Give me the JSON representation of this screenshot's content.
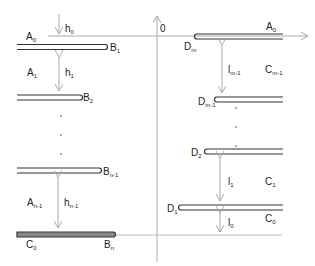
{
  "diagram": {
    "origin_label": "0",
    "left_plates": [
      {
        "name": "top",
        "left_label": "A",
        "left_sub": "0",
        "right_label": "B",
        "right_sub": "1"
      },
      {
        "name": "second",
        "right_label": "B",
        "right_sub": "2"
      },
      {
        "name": "penultimate",
        "right_label": "B",
        "right_sub": "n-1"
      },
      {
        "name": "bottom",
        "left_label": "C",
        "left_sub": "0",
        "right_label": "B",
        "right_sub": "n"
      }
    ],
    "left_regions": [
      {
        "label": "A",
        "sub": "1"
      },
      {
        "label": "A",
        "sub": "n-1"
      }
    ],
    "left_gaps": [
      {
        "label": "h",
        "sub": "0"
      },
      {
        "label": "h",
        "sub": "1"
      },
      {
        "label": "h",
        "sub": "n-1"
      }
    ],
    "right_plates": [
      {
        "name": "top",
        "left_label": "D",
        "left_sub": "m",
        "right_label": "A",
        "right_sub": "0"
      },
      {
        "name": "second",
        "left_label": "D",
        "left_sub": "m-1"
      },
      {
        "name": "third-from-bottom",
        "left_label": "D",
        "left_sub": "2"
      },
      {
        "name": "bottom",
        "left_label": "D",
        "left_sub": "1"
      }
    ],
    "right_regions": [
      {
        "label": "C",
        "sub": "m-1"
      },
      {
        "label": "C",
        "sub": "1"
      },
      {
        "label": "C",
        "sub": "0"
      }
    ],
    "right_gaps": [
      {
        "label": "l",
        "sub": "m-1"
      },
      {
        "label": "l",
        "sub": "1"
      },
      {
        "label": "l",
        "sub": "0"
      }
    ],
    "colors": {
      "plate": "#333333",
      "axis": "#aaaaaa",
      "arrow": "#aaaaaa"
    }
  }
}
